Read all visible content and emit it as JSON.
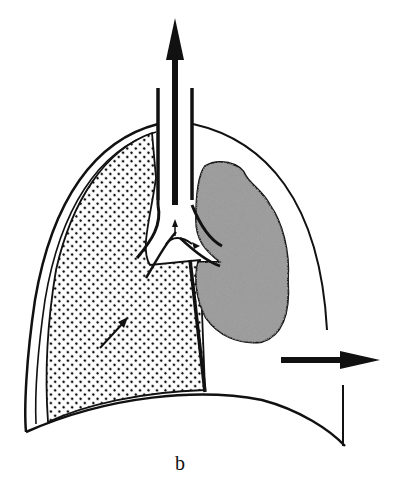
{
  "figure": {
    "caption": "b",
    "colors": {
      "ink": "#111111",
      "background": "#ffffff",
      "mass_fill": "#8a8a8a"
    },
    "elements": [
      {
        "name": "trachea",
        "description": "vertical airway with upward arrow"
      },
      {
        "name": "upward-arrow",
        "description": "arrow pointing up out of trachea"
      },
      {
        "name": "lung-outline",
        "description": "thoracic cavity outline"
      },
      {
        "name": "stippled-lung",
        "description": "dotted (stippled) collapsed/aerated lung region on left"
      },
      {
        "name": "mass",
        "description": "textured gray mass adjacent to bronchus on right"
      },
      {
        "name": "bronchial-tree",
        "description": "branching bronchi with small internal arrows"
      },
      {
        "name": "rightward-arrow",
        "description": "arrow pointing right toward chest wall"
      },
      {
        "name": "diaphragm",
        "description": "curved lower border"
      }
    ]
  }
}
